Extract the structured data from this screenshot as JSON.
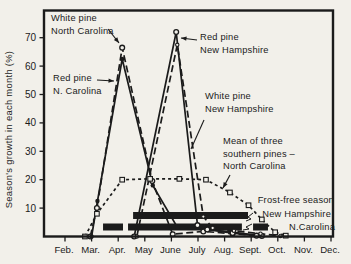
{
  "figure": {
    "y_axis_title": "Season's growth in each month (%)",
    "months": [
      "Feb.",
      "Mar.",
      "Apr.",
      "May",
      "June",
      "July",
      "Aug.",
      "Sept.",
      "Oct.",
      "Nov.",
      "Dec."
    ],
    "y_ticks": [
      10,
      20,
      30,
      40,
      50,
      60,
      70
    ],
    "colors": {
      "ink": "#1b1b1b",
      "paper": "#f2f0ea"
    },
    "annotations": {
      "white_pine_nc": {
        "line1": "White pine",
        "line2": "North Carolina"
      },
      "red_pine_nc": {
        "line1": "Red pine",
        "line2": "N. Carolina"
      },
      "red_pine_nh": {
        "line1": "Red pine",
        "line2": "New Hampshire"
      },
      "white_pine_nh": {
        "line1": "White pine",
        "line2": "New Hampshire"
      },
      "mean_southern": {
        "line1": "Mean of three",
        "line2": "southern pines –",
        "line3": "North Carolina"
      },
      "frost_free": {
        "title": "Frost-free season",
        "nh": "New Hampshire",
        "nc": "N.Carolina"
      }
    }
  },
  "chart_data": {
    "type": "line",
    "ylabel": "Season's growth in each month (%)",
    "ylim": [
      0,
      75
    ],
    "grid": false,
    "x_unit": "month index (Feb=0, Mar=1, Apr=2, May=3, June=4, July=5, Aug=6, Sept=7, Oct=8, Nov=9, Dec=10)",
    "x_tick_labels": [
      "Feb.",
      "Mar.",
      "Apr.",
      "May",
      "June",
      "July",
      "Aug.",
      "Sept.",
      "Oct.",
      "Nov.",
      "Dec."
    ],
    "series": [
      {
        "name": "White pine — North Carolina",
        "style": "dashed",
        "marker": "circle-open",
        "points": [
          [
            0.95,
            0
          ],
          [
            1.2,
            10
          ],
          [
            2.15,
            66.5
          ],
          [
            3.28,
            19.5
          ],
          [
            4.05,
            0.8
          ],
          [
            5.2,
            1.8
          ],
          [
            6.3,
            1
          ],
          [
            7.4,
            0.2
          ]
        ]
      },
      {
        "name": "Red pine — North Carolina",
        "style": "solid",
        "marker": "circle-filled",
        "points": [
          [
            1.0,
            0
          ],
          [
            1.22,
            12.5
          ],
          [
            2.15,
            62.5
          ],
          [
            3.3,
            18
          ],
          [
            4.22,
            3.3
          ],
          [
            5.3,
            2.5
          ],
          [
            6.3,
            1.5
          ],
          [
            7.3,
            0.3
          ]
        ]
      },
      {
        "name": "Red pine — New Hampshire",
        "style": "solid",
        "marker": "circle-open",
        "points": [
          [
            2.6,
            0
          ],
          [
            4.18,
            72
          ],
          [
            4.98,
            4
          ],
          [
            5.35,
            2.5
          ],
          [
            6.3,
            1.2
          ],
          [
            7.2,
            0.3
          ]
        ]
      },
      {
        "name": "White pine — New Hampshire",
        "style": "dashed",
        "marker": "circle-open-small",
        "points": [
          [
            2.7,
            0
          ],
          [
            4.22,
            67.5
          ],
          [
            5.2,
            7
          ],
          [
            5.55,
            3
          ],
          [
            6.35,
            2
          ],
          [
            7.35,
            1
          ],
          [
            8.1,
            0.2
          ]
        ]
      },
      {
        "name": "Mean of three southern pines — North Carolina",
        "style": "dotted",
        "marker": "square-open",
        "points": [
          [
            0.75,
            0
          ],
          [
            1.2,
            8
          ],
          [
            2.15,
            20
          ],
          [
            3.2,
            20.3
          ],
          [
            4.3,
            20.3
          ],
          [
            5.3,
            20
          ],
          [
            6.2,
            15.5
          ],
          [
            6.9,
            11
          ],
          [
            7.4,
            6
          ],
          [
            7.9,
            1.5
          ],
          [
            8.3,
            0.3
          ]
        ]
      }
    ],
    "frost_free_season": {
      "label": "Frost-free season",
      "bars": [
        {
          "name": "New Hampshire",
          "row": 0,
          "segments": [
            [
              2.56,
              6.88
            ]
          ]
        },
        {
          "name": "N.Carolina",
          "row": 1,
          "segments": [
            [
              1.43,
              2.18
            ],
            [
              2.37,
              6.65
            ],
            [
              7.07,
              7.63
            ]
          ]
        }
      ]
    }
  }
}
